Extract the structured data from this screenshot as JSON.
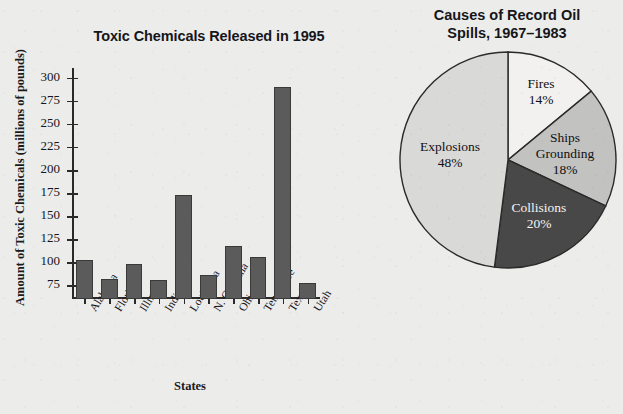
{
  "chart_data": [
    {
      "type": "bar",
      "title": "Toxic Chemicals Released in 1995",
      "xlabel": "States",
      "ylabel": "Amount of Toxic Chemicals (millions of pounds)",
      "categories": [
        "Alabama",
        "Florida",
        "Illinois",
        "Indiana",
        "Louisiana",
        "N. Carolina",
        "Ohio",
        "Tennessee",
        "Texas",
        "Utah"
      ],
      "values": [
        104,
        84,
        100,
        83,
        175,
        88,
        119,
        108,
        291,
        79
      ],
      "ytick_labels": [
        "75",
        "100",
        "125",
        "150",
        "175",
        "200",
        "225",
        "250",
        "275",
        "300"
      ],
      "ytick_values": [
        75,
        100,
        125,
        150,
        175,
        200,
        225,
        250,
        275,
        300
      ],
      "ylim": [
        62,
        312
      ],
      "grid": false,
      "legend": "none",
      "bar_color": "#5b5b5b",
      "bar_edge_color": "#3a3a3a"
    },
    {
      "type": "pie",
      "title": "Causes of Record Oil Spills, 1967–1983",
      "title_line1": "Causes of Record Oil",
      "title_line2": "Spills, 1967–1983",
      "labels": [
        "Fires",
        "Ships Grounding",
        "Collisions",
        "Explosions"
      ],
      "values": [
        14,
        18,
        20,
        48
      ],
      "value_labels": [
        "14%",
        "18%",
        "20%",
        "48%"
      ],
      "colors": [
        "#f2f1ef",
        "#c2c2c0",
        "#484848",
        "#d9d9d7"
      ],
      "start_angle_deg": 0,
      "direction": "clockwise",
      "legend": "none",
      "slice_label_lines": [
        [
          "Fires",
          "14%"
        ],
        [
          "Ships",
          "Grounding",
          "18%"
        ],
        [
          "Collisions",
          "20%"
        ],
        [
          "Explosions",
          "48%"
        ]
      ]
    }
  ],
  "bar_chart": {
    "title": "Toxic Chemicals Released in 1995",
    "y_axis_title": "Amount of Toxic Chemicals (millions of pounds)",
    "x_axis_title": "States"
  },
  "pie_chart": {
    "title_line1": "Causes of Record Oil",
    "title_line2": "Spills, 1967–1983",
    "slices": [
      {
        "name": "Fires",
        "pct": "14%",
        "line1": "Fires",
        "line2": "14%"
      },
      {
        "name": "Ships Grounding",
        "pct": "18%",
        "line1": "Ships",
        "line2": "Grounding",
        "line3": "18%"
      },
      {
        "name": "Collisions",
        "pct": "20%",
        "line1": "Collisions",
        "line2": "20%"
      },
      {
        "name": "Explosions",
        "pct": "48%",
        "line1": "Explosions",
        "line2": "48%"
      }
    ]
  }
}
